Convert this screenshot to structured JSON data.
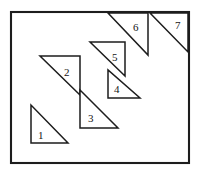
{
  "figure": {
    "background_color": "#ffffff",
    "stroke_color": "#1d1d1d",
    "frame": {
      "x": 11,
      "y": 12,
      "width": 178,
      "height": 151
    },
    "labels": [
      {
        "id": "1",
        "text": "1",
        "x": 38,
        "y": 130
      },
      {
        "id": "2",
        "text": "2",
        "x": 64,
        "y": 67
      },
      {
        "id": "3",
        "text": "3",
        "x": 88,
        "y": 113
      },
      {
        "id": "4",
        "text": "4",
        "x": 114,
        "y": 84
      },
      {
        "id": "5",
        "text": "5",
        "x": 112,
        "y": 52
      },
      {
        "id": "6",
        "text": "6",
        "x": 133,
        "y": 22
      },
      {
        "id": "7",
        "text": "7",
        "x": 175,
        "y": 20
      }
    ]
  },
  "chart_data": {
    "type": "diagram",
    "xlim": [
      0,
      206
    ],
    "ylim": [
      0,
      178
    ],
    "shapes": [
      {
        "name": "triangle-1",
        "label": "1",
        "kind": "right-triangle",
        "points": "31,105 31,143 68,143"
      },
      {
        "name": "triangle-2",
        "label": "2",
        "kind": "right-triangle",
        "points": "40,56 80,56 80,95"
      },
      {
        "name": "triangle-3",
        "label": "3",
        "kind": "right-triangle",
        "points": "80,90 80,128 118,128"
      },
      {
        "name": "triangle-5",
        "label": "5",
        "kind": "right-triangle",
        "points": "90,42 125,42 125,76"
      },
      {
        "name": "triangle-4",
        "label": "4",
        "kind": "right-triangle",
        "points": "108,70 108,98 140,98"
      },
      {
        "name": "triangle-6",
        "label": "6",
        "kind": "right-triangle",
        "points": "108,13 148,13 148,55"
      },
      {
        "name": "triangle-7",
        "label": "7",
        "kind": "right-triangle",
        "points": "150,13 188,13 188,52"
      }
    ]
  }
}
